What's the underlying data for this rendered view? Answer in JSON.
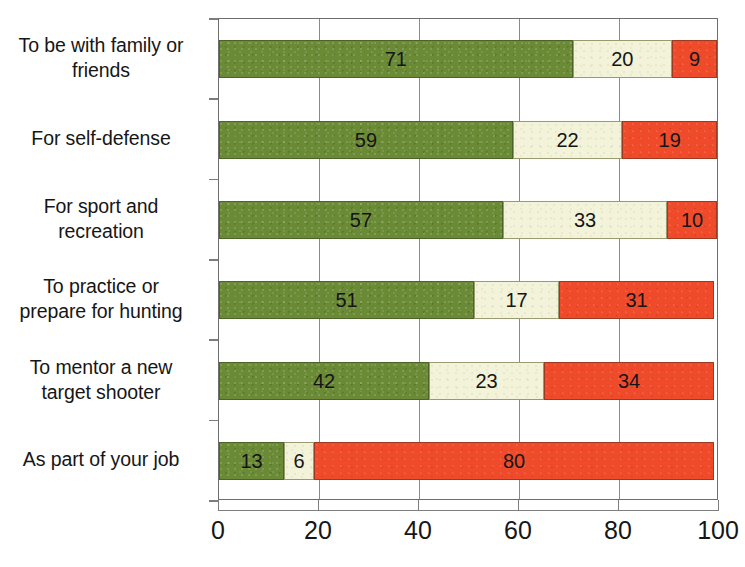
{
  "chart": {
    "type": "bar",
    "orientation": "horizontal-stacked",
    "title": "",
    "xlabel": "",
    "ylabel": ""
  },
  "chart_data": {
    "type": "bar",
    "title": "",
    "subtitle": "",
    "xlabel": "",
    "ylabel": "",
    "xlim": [
      0,
      100
    ],
    "ticks": [
      "0",
      "20",
      "40",
      "60",
      "80",
      "100"
    ],
    "tick_values": [
      0,
      20,
      40,
      60,
      80,
      100
    ],
    "grid": true,
    "legend": null,
    "legend_position": "none",
    "stacked": true,
    "categories": [
      "To be with family or friends",
      "For self-defense",
      "For sport and recreation",
      "To practice or prepare for hunting",
      "To mentor a new target shooter",
      "As part of your job"
    ],
    "series": [
      {
        "name": "green",
        "color": "#6b8a35",
        "values": [
          71,
          59,
          57,
          51,
          42,
          13
        ]
      },
      {
        "name": "cream",
        "color": "#f2f3d8",
        "values": [
          20,
          22,
          33,
          17,
          23,
          6
        ]
      },
      {
        "name": "red",
        "color": "#ef4b2b",
        "values": [
          9,
          19,
          10,
          31,
          34,
          80
        ]
      }
    ],
    "rows": [
      {
        "label_lines": [
          "To be with family or",
          "friends"
        ],
        "segments": [
          {
            "value": 71,
            "label": "71"
          },
          {
            "value": 20,
            "label": "20"
          },
          {
            "value": 9,
            "label": "9"
          }
        ]
      },
      {
        "label_lines": [
          "For self-defense"
        ],
        "segments": [
          {
            "value": 59,
            "label": "59"
          },
          {
            "value": 22,
            "label": "22"
          },
          {
            "value": 19,
            "label": "19"
          }
        ]
      },
      {
        "label_lines": [
          "For sport and",
          "recreation"
        ],
        "segments": [
          {
            "value": 57,
            "label": "57"
          },
          {
            "value": 33,
            "label": "33"
          },
          {
            "value": 10,
            "label": "10"
          }
        ]
      },
      {
        "label_lines": [
          "To practice or",
          "prepare for hunting"
        ],
        "segments": [
          {
            "value": 51,
            "label": "51"
          },
          {
            "value": 17,
            "label": "17"
          },
          {
            "value": 31,
            "label": "31"
          }
        ]
      },
      {
        "label_lines": [
          "To mentor a new",
          "target shooter"
        ],
        "segments": [
          {
            "value": 42,
            "label": "42"
          },
          {
            "value": 23,
            "label": "23"
          },
          {
            "value": 34,
            "label": "34"
          }
        ]
      },
      {
        "label_lines": [
          "As part of your job"
        ],
        "segments": [
          {
            "value": 13,
            "label": "13"
          },
          {
            "value": 6,
            "label": "6"
          },
          {
            "value": 80,
            "label": "80"
          }
        ]
      }
    ]
  },
  "colors": {
    "series_green": "#6b8a35",
    "series_cream": "#f2f3d8",
    "series_red": "#ef4b2b",
    "grid": "#8a8a8a",
    "axis": "#7d7d7d",
    "text": "#161616",
    "background": "#ffffff"
  }
}
